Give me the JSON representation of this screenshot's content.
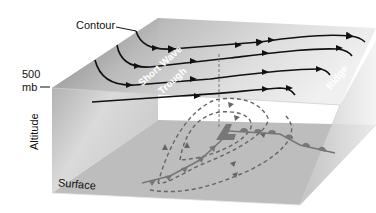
{
  "diagram": {
    "type": "3D block diagram",
    "labels": {
      "contour": "Contour",
      "level_500": "500",
      "level_unit": "mb",
      "altitude": "Altitude",
      "surface": "Surface",
      "trough_line1": "Short Wave",
      "trough_line2": "Trough",
      "ridge": "Ridge"
    },
    "upper_level": {
      "pressure_level": "500 mb",
      "contour_count": 4,
      "features": [
        "Short Wave Trough",
        "Ridge"
      ],
      "flow": "west-to-east with arrowheads along contours"
    },
    "surface_level": {
      "features": [
        "surface low",
        "warm front",
        "cold front",
        "dashed circulation arrows"
      ]
    },
    "colors": {
      "contour_line": "#111111",
      "dashed_flow": "#666666",
      "front_line": "#777777",
      "surface_face": "#bdbdbd",
      "top_face_dark": "#8a8a8a",
      "top_face_light": "#e6e6e6"
    }
  }
}
